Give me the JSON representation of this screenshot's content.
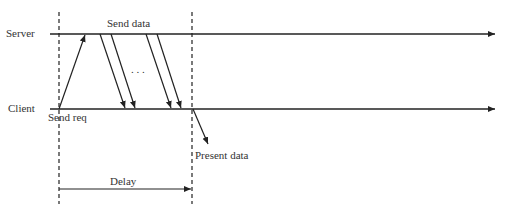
{
  "diagram": {
    "type": "sequence-timing",
    "lanes": {
      "server": "Server",
      "client": "Client"
    },
    "labels": {
      "send_data": "Send data",
      "send_req": "Send req",
      "present_data": "Present data",
      "delay": "Delay",
      "ellipsis": ". . ."
    },
    "colors": {
      "line": "#222222",
      "text": "#333333",
      "background": "#ffffff"
    }
  }
}
